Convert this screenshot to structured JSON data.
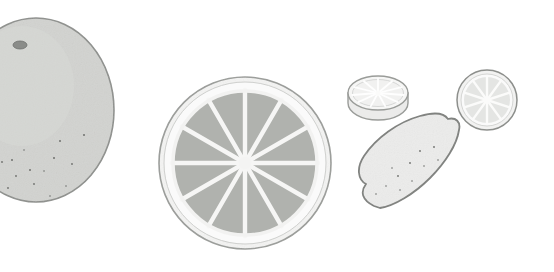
{
  "illustration": {
    "title": "Citrus fruit study",
    "subject": "citrus fruits",
    "style": "flat grayscale botanical illustration",
    "background_color": "#ffffff",
    "canvas": {
      "width": 554,
      "height": 272
    },
    "palette": {
      "background": "#ffffff",
      "rind_fill": "#d2d3d0",
      "rind_outline": "#8d8f8c",
      "pith_fill": "#f4f4f3",
      "pith_outline": "#9a9c99",
      "segment_fill": "#b0b2ae",
      "segment_divider": "#f6f6f5",
      "lemon_fill": "#ececeb",
      "lemon_outline": "#7d7f7c",
      "pale_slice_fill": "#f2f2f1",
      "pale_segment_fill": "#e4e5e3",
      "stem_fill": "#8a8c89",
      "speckle": "#6f716e"
    },
    "objects": [
      {
        "id": "large-whole-fruit",
        "name": "large whole grapefruit",
        "kind": "whole-fruit",
        "position": {
          "cx": 36,
          "cy": 110
        },
        "size": {
          "rx": 78,
          "ry": 92
        },
        "fill": "#d2d3d0",
        "outline": "#8d8f8c",
        "has_stem": true,
        "stem": {
          "cx": 20,
          "cy": 45,
          "rx": 7,
          "ry": 4,
          "fill": "#8a8c89"
        },
        "speckle_count": 14,
        "notes": "cropped by the left edge of the frame"
      },
      {
        "id": "center-cross-section",
        "name": "large citrus cross-section",
        "kind": "cross-section",
        "position": {
          "cx": 245,
          "cy": 163
        },
        "size": {
          "r": 86
        },
        "segments": 12,
        "pith_fill": "#f4f4f3",
        "pith_outline": "#9a9c99",
        "segment_fill": "#b0b2ae",
        "segment_divider": "#f6f6f5",
        "pith_thickness": 14
      },
      {
        "id": "thick-angled-slice",
        "name": "thick citrus slice in perspective",
        "kind": "slice-perspective",
        "position": {
          "cx": 378,
          "cy": 93
        },
        "size": {
          "rx": 30,
          "ry": 17
        },
        "thickness": 10,
        "segments": 11,
        "fill": "#f2f2f1",
        "outline": "#9a9c99"
      },
      {
        "id": "right-round-slice",
        "name": "small round citrus slice",
        "kind": "cross-section",
        "position": {
          "cx": 487,
          "cy": 100
        },
        "size": {
          "r": 30
        },
        "segments": 10,
        "fill": "#f2f2f1",
        "segment_fill": "#e4e5e3",
        "outline": "#8d8f8c"
      },
      {
        "id": "whole-lemon",
        "name": "whole lemon, tilted",
        "kind": "whole-fruit",
        "position": {
          "cx": 416,
          "cy": 164
        },
        "size": {
          "rx": 54,
          "ry": 34
        },
        "rotation_deg": -35,
        "fill": "#ececeb",
        "outline": "#7d7f7c",
        "has_nub": true,
        "speckle_count": 11
      }
    ],
    "object_count": 5
  }
}
